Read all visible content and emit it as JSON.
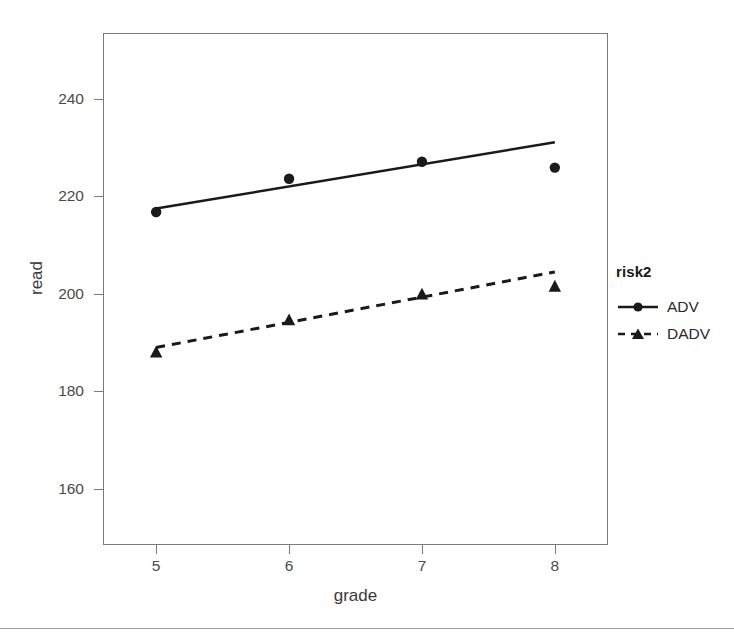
{
  "chart_data": {
    "type": "line",
    "title": "",
    "subtitle": "",
    "xlabel": "grade",
    "ylabel": "read",
    "x": [
      5,
      6,
      7,
      8
    ],
    "xtick_labels": [
      "5",
      "6",
      "7",
      "8"
    ],
    "ytick_labels": [
      "160",
      "180",
      "200",
      "220",
      "240"
    ],
    "ytick_values": [
      160,
      180,
      200,
      220,
      240
    ],
    "xlim": [
      4.6,
      8.4
    ],
    "ylim": [
      148.5,
      253.5
    ],
    "grid": false,
    "legend_position": "right",
    "legend_title": "risk2",
    "series": [
      {
        "name": "ADV",
        "marker": "circle",
        "linestyle": "solid",
        "color": "#1a1a1a",
        "values": [
          216.8,
          223.6,
          227.1,
          225.9
        ],
        "fit_endpoints": [
          217.5,
          231.1
        ]
      },
      {
        "name": "DADV",
        "marker": "triangle",
        "linestyle": "dashed",
        "color": "#1a1a1a",
        "values": [
          188.1,
          194.7,
          200.0,
          201.6
        ],
        "fit_endpoints": [
          189.0,
          204.5
        ]
      }
    ]
  },
  "axes": {
    "x_title": "grade",
    "y_title": "read",
    "x_ticks": [
      "5",
      "6",
      "7",
      "8"
    ],
    "y_ticks": [
      "240",
      "220",
      "200",
      "180",
      "160"
    ]
  },
  "legend": {
    "title": "risk2",
    "entries": [
      {
        "label": "ADV",
        "key": "solid-line-circle-marker"
      },
      {
        "label": "DADV",
        "key": "dashed-line-triangle-marker"
      }
    ]
  },
  "colors": {
    "ink": "#1a1a1a",
    "axis": "#7a7a7a",
    "tick_text": "#4a4a4a",
    "title_text": "#3a3a3a",
    "background": "#ffffff"
  }
}
